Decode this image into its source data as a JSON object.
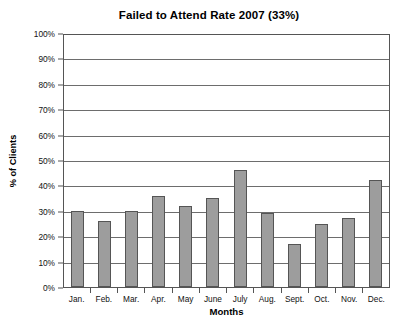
{
  "chart_data": {
    "type": "bar",
    "title": "Failed to Attend Rate 2007 (33%)",
    "xlabel": "Months",
    "ylabel": "% of Clients",
    "categories": [
      "Jan.",
      "Feb.",
      "Mar.",
      "Apr.",
      "May",
      "June",
      "July",
      "Aug.",
      "Sept.",
      "Oct.",
      "Nov.",
      "Dec."
    ],
    "values": [
      30,
      26,
      30,
      36,
      32,
      35,
      46,
      29,
      17,
      25,
      27,
      42
    ],
    "series": [
      {
        "name": "Failed to Attend Rate",
        "values": [
          30,
          26,
          30,
          36,
          32,
          35,
          46,
          29,
          17,
          25,
          27,
          42
        ]
      }
    ],
    "ylim": [
      0,
      100
    ],
    "ytick_values": [
      0,
      10,
      20,
      30,
      40,
      50,
      60,
      70,
      80,
      90,
      100
    ],
    "ytick_labels": [
      "0%",
      "10%",
      "20%",
      "30%",
      "40%",
      "50%",
      "60%",
      "70%",
      "80%",
      "90%",
      "100%"
    ],
    "grid": true,
    "legend": false,
    "legend_position": "none",
    "bar_fill_color": "#9d9d9d",
    "bar_border_color": "#555555",
    "gridline_color": "#6d6d6d",
    "axis_color": "#555555",
    "background_color": "#ffffff",
    "overall_rate_label": "33%"
  }
}
